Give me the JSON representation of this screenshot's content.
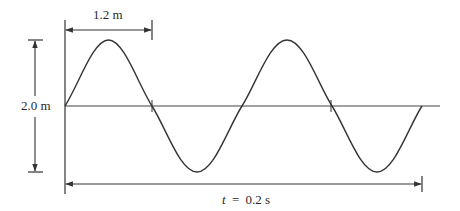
{
  "diagram": {
    "type": "transverse-wave",
    "colors": {
      "stroke": "#333333",
      "background": "#ffffff"
    },
    "wavelength_label": "1.2 m",
    "amplitude_label": "2.0 m",
    "time_label": {
      "variable": "t",
      "equals": "=",
      "value": "0.2 s"
    },
    "cycles_shown": 2,
    "peaks": 2,
    "troughs": 2
  }
}
